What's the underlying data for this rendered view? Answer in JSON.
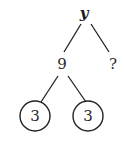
{
  "diagram": {
    "type": "factor-tree",
    "root": {
      "label": "y"
    },
    "level1": [
      {
        "label": "9"
      },
      {
        "label": "?"
      }
    ],
    "level2": [
      {
        "label": "3",
        "circled": true
      },
      {
        "label": "3",
        "circled": true
      }
    ]
  }
}
